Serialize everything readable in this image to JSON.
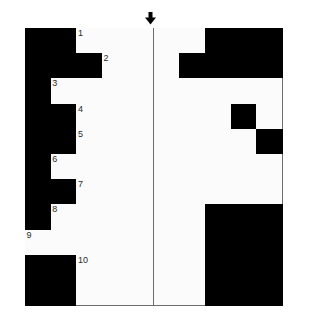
{
  "page": {
    "top_caption": "",
    "background_color": "#ffffff"
  },
  "marker": {
    "name": "down-arrow",
    "glyph": "↓",
    "color": "#000000",
    "points_to_column": 5,
    "x": 144,
    "y": 12
  },
  "grid": {
    "columns": 10,
    "rows": 11,
    "cell_width": 25.7,
    "cell_height": 25.2,
    "origin_x": 25,
    "origin_y": 28,
    "white_color": "#fbfbfb",
    "black_color": "#000000",
    "line_color": "#6d6d6d",
    "clue_numbers": [
      {
        "number": "1",
        "row": 1,
        "col": 3
      },
      {
        "number": "2",
        "row": 2,
        "col": 4
      },
      {
        "number": "3",
        "row": 3,
        "col": 2
      },
      {
        "number": "4",
        "row": 4,
        "col": 3
      },
      {
        "number": "5",
        "row": 5,
        "col": 3
      },
      {
        "number": "6",
        "row": 6,
        "col": 2
      },
      {
        "number": "7",
        "row": 7,
        "col": 3
      },
      {
        "number": "8",
        "row": 8,
        "col": 2
      },
      {
        "number": "9",
        "row": 9,
        "col": 1
      },
      {
        "number": "10",
        "row": 10,
        "col": 3
      }
    ],
    "cells": [
      [
        "black",
        "black",
        "white",
        "white",
        "white",
        "white",
        "white",
        "black",
        "black",
        "black"
      ],
      [
        "black",
        "black",
        "black",
        "white",
        "white",
        "white",
        "black",
        "black",
        "black",
        "black"
      ],
      [
        "black",
        "white",
        "white",
        "white",
        "white",
        "white",
        "white",
        "white",
        "white",
        "white"
      ],
      [
        "black",
        "black",
        "white",
        "white",
        "white",
        "white",
        "white",
        "white",
        "black",
        "white"
      ],
      [
        "black",
        "black",
        "white",
        "white",
        "white",
        "white",
        "white",
        "white",
        "white",
        "black"
      ],
      [
        "black",
        "white",
        "white",
        "white",
        "white",
        "white",
        "white",
        "white",
        "white",
        "white"
      ],
      [
        "black",
        "black",
        "white",
        "white",
        "white",
        "white",
        "white",
        "white",
        "white",
        "white"
      ],
      [
        "black",
        "white",
        "white",
        "white",
        "white",
        "white",
        "white",
        "black",
        "black",
        "black"
      ],
      [
        "white",
        "white",
        "white",
        "white",
        "white",
        "white",
        "white",
        "black",
        "black",
        "black"
      ],
      [
        "black",
        "black",
        "white",
        "white",
        "white",
        "white",
        "white",
        "black",
        "black",
        "black"
      ],
      [
        "black",
        "black",
        "white",
        "white",
        "white",
        "white",
        "white",
        "black",
        "black",
        "black"
      ]
    ]
  }
}
